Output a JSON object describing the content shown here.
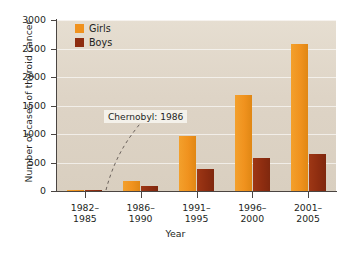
{
  "chart_data": {
    "type": "bar",
    "title": "",
    "subtitle": "",
    "xlabel": "Year",
    "ylabel": "Number of cases of thyroid cancer",
    "categories": [
      "1982–\n1985",
      "1986–\n1990",
      "1991–\n1995",
      "1996–\n2000",
      "2001–\n2005"
    ],
    "category_lines": [
      [
        "1982–",
        "1985"
      ],
      [
        "1986–",
        "1990"
      ],
      [
        "1991–",
        "1995"
      ],
      [
        "1996–",
        "2000"
      ],
      [
        "2001–",
        "2005"
      ]
    ],
    "series": [
      {
        "name": "Girls",
        "color": "#f0921e",
        "values": [
          25,
          180,
          965,
          1690,
          2580
        ]
      },
      {
        "name": "Boys",
        "color": "#8e2d10",
        "values": [
          15,
          80,
          390,
          580,
          655
        ]
      }
    ],
    "ylim": [
      0,
      3000
    ],
    "yticks": [
      0,
      500,
      1000,
      1500,
      2000,
      2500,
      3000
    ],
    "ytick_labels": [
      "0",
      "500",
      "1000",
      "1500",
      "2000",
      "2500",
      "3000"
    ],
    "grid": true,
    "grid_orientation": "horizontal",
    "legend_position": "top-left",
    "annotations": [
      {
        "text": "Chernobyl: 1986",
        "leader": "dashed-curve"
      }
    ],
    "plot_background": "#ded4c6",
    "page_background": "#ffffff"
  },
  "legend": {
    "items": [
      {
        "label": "Girls"
      },
      {
        "label": "Boys"
      }
    ]
  },
  "annotation": {
    "chernobyl_label": "Chernobyl: 1986"
  },
  "axes": {
    "y_title": "Number of cases of thyroid cancer",
    "x_title": "Year"
  }
}
